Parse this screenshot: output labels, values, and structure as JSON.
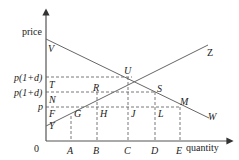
{
  "diagram": {
    "axes": {
      "y_label": "price",
      "x_label": "quantity",
      "origin_label": "0"
    },
    "price_labels": {
      "top": "p(1+d)",
      "middle": "p(1+d)",
      "base": "p"
    },
    "quantity_labels": [
      "A",
      "B",
      "C",
      "D",
      "E"
    ],
    "curves": {
      "demand": {
        "start": "V",
        "end": "W"
      },
      "supply": {
        "start": "Y",
        "end": "Z"
      }
    },
    "points": {
      "V": "V",
      "T": "T",
      "N": "N",
      "F": "F",
      "Y": "Y",
      "G": "G",
      "H": "H",
      "R": "R",
      "U": "U",
      "J": "J",
      "S": "S",
      "L": "L",
      "M": "M",
      "Z": "Z",
      "W": "W"
    }
  }
}
